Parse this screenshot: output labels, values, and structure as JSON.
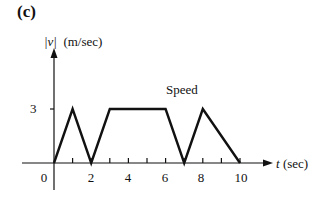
{
  "panel_label": "(c)",
  "chart_data": {
    "type": "line",
    "title": "",
    "series_label": "Speed",
    "ylabel": "|v| (m/sec)",
    "ylabel_var": "|v|",
    "ylabel_unit": "(m/sec)",
    "xlabel": "t (sec)",
    "xlabel_var": "t",
    "xlabel_unit": "(sec)",
    "x_tick_labels": [
      "0",
      "2",
      "4",
      "6",
      "8",
      "10"
    ],
    "x_minor_ticks": [
      1,
      2,
      3,
      4,
      5,
      6,
      7,
      8,
      9,
      10
    ],
    "y_tick_labels": [
      "3"
    ],
    "xlim": [
      0,
      10
    ],
    "ylim": [
      0,
      3
    ],
    "grid": false,
    "series": [
      {
        "name": "Speed",
        "x": [
          0,
          1,
          2,
          3,
          6,
          7,
          8,
          10
        ],
        "y": [
          0,
          3,
          0,
          3,
          3,
          0,
          3,
          0
        ]
      }
    ]
  }
}
